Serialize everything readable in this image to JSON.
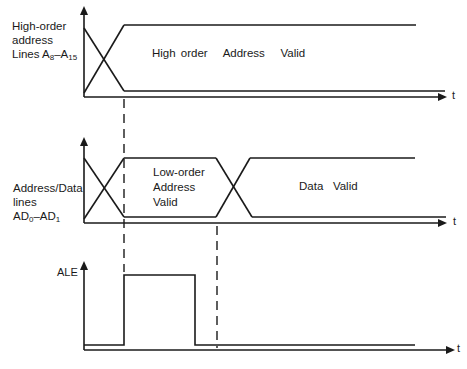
{
  "diagram": {
    "time_axis_label": "t",
    "signals": [
      {
        "id": "high_order",
        "label_lines": [
          "High-order",
          "address"
        ],
        "label_line3_prefix": "Lines A",
        "label_sub_a": "8",
        "label_mid": "–A",
        "label_sub_b": "15",
        "region_text": "High order   Address   Valid"
      },
      {
        "id": "address_data",
        "label_lines": [
          "Address/Data",
          "lines"
        ],
        "label_line3_prefix": "AD",
        "label_sub_a": "0",
        "label_mid": "–AD",
        "label_sub_b": "1",
        "region_text_lines": [
          "Low-order",
          "Address",
          "Valid"
        ],
        "region_text_2": "Data   Valid"
      },
      {
        "id": "ale",
        "label": "ALE"
      }
    ],
    "colors": {
      "line": "#1a1a1a",
      "background": "#ffffff"
    }
  }
}
